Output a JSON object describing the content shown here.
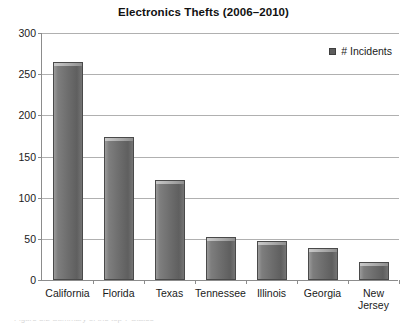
{
  "chart_data": {
    "type": "bar",
    "title": "Electronics Thefts (2006–2010)",
    "xlabel": "",
    "ylabel": "",
    "ylim": [
      0,
      300
    ],
    "yticks": [
      0,
      50,
      100,
      150,
      200,
      250,
      300
    ],
    "grid": true,
    "legend_position": "top-right",
    "categories": [
      "California",
      "Florida",
      "Texas",
      "Tennessee",
      "Illinois",
      "Georgia",
      "New\nJersey"
    ],
    "series": [
      {
        "name": "# Incidents",
        "color": "#6e6e6e",
        "values": [
          265,
          174,
          122,
          52,
          47,
          39,
          22
        ]
      }
    ]
  },
  "legend": {
    "entries": [
      {
        "label": "# Incidents",
        "marker": "square-marker"
      }
    ]
  },
  "axes": {
    "y_tick_labels": [
      "0",
      "50",
      "100",
      "150",
      "200",
      "250",
      "300"
    ]
  },
  "caption": {
    "fragment": "Figure 3.2 Summary of the top 7 States"
  }
}
